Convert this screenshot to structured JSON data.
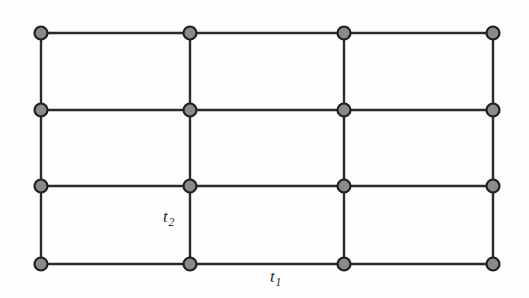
{
  "figure": {
    "name": "square-lattice-hopping-diagram",
    "background_color": "#fefefe",
    "width": 529,
    "height": 298
  },
  "lattice": {
    "type": "square-lattice",
    "columns": 4,
    "rows": 4,
    "node_count": 16,
    "node_x_positions": [
      41,
      190,
      344,
      493
    ],
    "node_y_positions": [
      33,
      110,
      186,
      264
    ],
    "node_radius": 6.5,
    "node_fill_color": "#8a8a8a",
    "node_stroke_color": "#1f1f1f",
    "node_stroke_width": 2.2,
    "edge_color": "#2a2a2a",
    "edge_width": 2.4,
    "horizontal_edges_per_row": 3,
    "vertical_edges_per_column": 3
  },
  "labels": {
    "t2": {
      "base": "t",
      "subscript": "2",
      "full": "t2",
      "x": 163,
      "y": 208,
      "describes": "vertical-bond-hopping-amplitude"
    },
    "t1": {
      "base": "t",
      "subscript": "1",
      "full": "t1",
      "x": 270,
      "y": 268,
      "describes": "horizontal-bond-hopping-amplitude"
    }
  },
  "chart_data": {
    "type": "diagram",
    "title": "",
    "xlabel": "",
    "ylabel": "",
    "nodes": [
      {
        "id": "n00",
        "col": 0,
        "row": 0,
        "x": 41,
        "y": 33
      },
      {
        "id": "n10",
        "col": 1,
        "row": 0,
        "x": 190,
        "y": 33
      },
      {
        "id": "n20",
        "col": 2,
        "row": 0,
        "x": 344,
        "y": 33
      },
      {
        "id": "n30",
        "col": 3,
        "row": 0,
        "x": 493,
        "y": 33
      },
      {
        "id": "n01",
        "col": 0,
        "row": 1,
        "x": 41,
        "y": 110
      },
      {
        "id": "n11",
        "col": 1,
        "row": 1,
        "x": 190,
        "y": 110
      },
      {
        "id": "n21",
        "col": 2,
        "row": 1,
        "x": 344,
        "y": 110
      },
      {
        "id": "n31",
        "col": 3,
        "row": 1,
        "x": 493,
        "y": 110
      },
      {
        "id": "n02",
        "col": 0,
        "row": 2,
        "x": 41,
        "y": 186
      },
      {
        "id": "n12",
        "col": 1,
        "row": 2,
        "x": 190,
        "y": 186
      },
      {
        "id": "n22",
        "col": 2,
        "row": 2,
        "x": 344,
        "y": 186
      },
      {
        "id": "n32",
        "col": 3,
        "row": 2,
        "x": 493,
        "y": 186
      },
      {
        "id": "n03",
        "col": 0,
        "row": 3,
        "x": 41,
        "y": 264
      },
      {
        "id": "n13",
        "col": 1,
        "row": 3,
        "x": 190,
        "y": 264
      },
      {
        "id": "n23",
        "col": 2,
        "row": 3,
        "x": 344,
        "y": 264
      },
      {
        "id": "n33",
        "col": 3,
        "row": 3,
        "x": 493,
        "y": 264
      }
    ],
    "edges": [
      {
        "from": "n00",
        "to": "n10",
        "kind": "horizontal",
        "label": "t1"
      },
      {
        "from": "n10",
        "to": "n20",
        "kind": "horizontal",
        "label": "t1"
      },
      {
        "from": "n20",
        "to": "n30",
        "kind": "horizontal",
        "label": "t1"
      },
      {
        "from": "n01",
        "to": "n11",
        "kind": "horizontal",
        "label": "t1"
      },
      {
        "from": "n11",
        "to": "n21",
        "kind": "horizontal",
        "label": "t1"
      },
      {
        "from": "n21",
        "to": "n31",
        "kind": "horizontal",
        "label": "t1"
      },
      {
        "from": "n02",
        "to": "n12",
        "kind": "horizontal",
        "label": "t1"
      },
      {
        "from": "n12",
        "to": "n22",
        "kind": "horizontal",
        "label": "t1"
      },
      {
        "from": "n22",
        "to": "n32",
        "kind": "horizontal",
        "label": "t1"
      },
      {
        "from": "n03",
        "to": "n13",
        "kind": "horizontal",
        "label": "t1"
      },
      {
        "from": "n13",
        "to": "n23",
        "kind": "horizontal",
        "label": "t1"
      },
      {
        "from": "n23",
        "to": "n33",
        "kind": "horizontal",
        "label": "t1"
      },
      {
        "from": "n00",
        "to": "n01",
        "kind": "vertical",
        "label": "t2"
      },
      {
        "from": "n01",
        "to": "n02",
        "kind": "vertical",
        "label": "t2"
      },
      {
        "from": "n02",
        "to": "n03",
        "kind": "vertical",
        "label": "t2"
      },
      {
        "from": "n10",
        "to": "n11",
        "kind": "vertical",
        "label": "t2"
      },
      {
        "from": "n11",
        "to": "n12",
        "kind": "vertical",
        "label": "t2"
      },
      {
        "from": "n12",
        "to": "n13",
        "kind": "vertical",
        "label": "t2"
      },
      {
        "from": "n20",
        "to": "n21",
        "kind": "vertical",
        "label": "t2"
      },
      {
        "from": "n21",
        "to": "n22",
        "kind": "vertical",
        "label": "t2"
      },
      {
        "from": "n22",
        "to": "n23",
        "kind": "vertical",
        "label": "t2"
      },
      {
        "from": "n30",
        "to": "n31",
        "kind": "vertical",
        "label": "t2"
      },
      {
        "from": "n31",
        "to": "n32",
        "kind": "vertical",
        "label": "t2"
      },
      {
        "from": "n32",
        "to": "n33",
        "kind": "vertical",
        "label": "t2"
      }
    ],
    "annotations": [
      {
        "text": "t2",
        "x": 163,
        "y": 208
      },
      {
        "text": "t1",
        "x": 270,
        "y": 268
      }
    ]
  }
}
